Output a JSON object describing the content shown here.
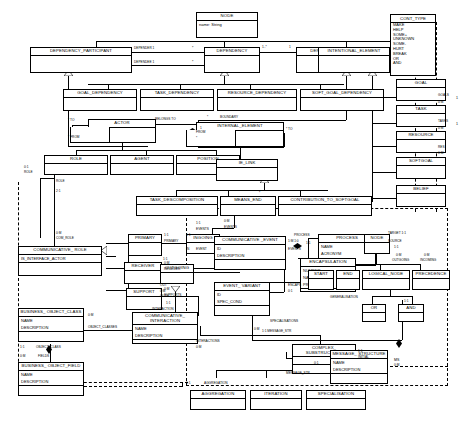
{
  "diagram": {
    "classes": [
      {
        "id": "node_top",
        "name": "NODE",
        "attrs": [
          "name: String"
        ]
      },
      {
        "id": "dependency_participant",
        "name": "DEPENDENCY_PARTICIPANT",
        "attrs": []
      },
      {
        "id": "dependency",
        "name": "DEPENDENCY",
        "attrs": []
      },
      {
        "id": "dependum",
        "name": "DEPENDUM",
        "attrs": []
      },
      {
        "id": "intentional_element",
        "name": "INTENTIONAL_ELEMENT",
        "attrs": []
      },
      {
        "id": "goal_dependency",
        "name": "GOAL_DEPENDENCY",
        "attrs": []
      },
      {
        "id": "task_dependency",
        "name": "TASK_DEPENDENCY",
        "attrs": []
      },
      {
        "id": "resource_dependency",
        "name": "RESOURCE_DEPENDENCY",
        "attrs": []
      },
      {
        "id": "soft_goal_dependency",
        "name": "SOFT_GOAL_DEPENDENCY",
        "attrs": []
      },
      {
        "id": "actor",
        "name": "ACTOR",
        "attrs": []
      },
      {
        "id": "internal_element",
        "name": "INTERNAL_ELEMENT",
        "attrs": [
          "TYPE: CONT_TYPE"
        ]
      },
      {
        "id": "role",
        "name": "ROLE",
        "attrs": []
      },
      {
        "id": "agent",
        "name": "AGENT",
        "attrs": []
      },
      {
        "id": "position",
        "name": "POSITION",
        "attrs": []
      },
      {
        "id": "ie_link",
        "name": "IE_LINK",
        "attrs": []
      },
      {
        "id": "task_descomposition",
        "name": "TASK_DESCOMPOSITION",
        "attrs": []
      },
      {
        "id": "means_end",
        "name": "MEANS_END",
        "attrs": []
      },
      {
        "id": "contribution_to_softgoal",
        "name": "CONTRIBUTION_TO_SOFTGOAL",
        "attrs": []
      },
      {
        "id": "goal",
        "name": "GOAL",
        "attrs": []
      },
      {
        "id": "task",
        "name": "TASK",
        "attrs": []
      },
      {
        "id": "resource",
        "name": "RESOURCE",
        "attrs": []
      },
      {
        "id": "softgoal",
        "name": "SOFTGOAL",
        "attrs": []
      },
      {
        "id": "belief",
        "name": "BELIEF",
        "attrs": []
      },
      {
        "id": "primary",
        "name": "PRIMARY",
        "attrs": []
      },
      {
        "id": "receiver",
        "name": "RECEIVER",
        "attrs": []
      },
      {
        "id": "support",
        "name": "SUPPORT",
        "attrs": []
      },
      {
        "id": "ingoing",
        "name": "INGOING",
        "attrs": []
      },
      {
        "id": "outgoing",
        "name": "OUTGOING",
        "attrs": []
      },
      {
        "id": "communicative_role",
        "name": "COMMUNICATIVE_ ROLE",
        "attrs": [
          "IS_INTERFACE_ACTOR"
        ]
      },
      {
        "id": "business_object_class",
        "name": "BUSINESS_ OBJECT_CLASS",
        "attrs": [
          "NAME",
          "DESCRIPTION"
        ]
      },
      {
        "id": "business_object_field",
        "name": "BUSINESS_ OBJECT_FIELD",
        "attrs": [
          "NAME",
          "DESCRIPTION"
        ]
      },
      {
        "id": "communicative_event",
        "name": "COMMUNICATIVE _EVENT",
        "attrs": [
          "ID",
          "DESCRIPTION"
        ]
      },
      {
        "id": "event_variant",
        "name": "EVENT_ VARIANT",
        "attrs": [
          "ID",
          "SPEC_COND"
        ]
      },
      {
        "id": "communicative_interaction",
        "name": "COMMUNICATIVE_ INTERACTION",
        "attrs": [
          "NAME",
          "DESCRIPTION"
        ]
      },
      {
        "id": "process",
        "name": "PROCESS",
        "attrs": [
          "NAME",
          "ACRONYM",
          "DESCRIPTION"
        ]
      },
      {
        "id": "encapsulation",
        "name": "ENCAPSULATION",
        "attrs": [
          "NUMBER",
          "NAME",
          "PRECONDITION"
        ]
      },
      {
        "id": "node_flow",
        "name": "NODE",
        "attrs": []
      },
      {
        "id": "start",
        "name": "START",
        "attrs": []
      },
      {
        "id": "end",
        "name": "END",
        "attrs": []
      },
      {
        "id": "logical_node",
        "name": "LOGICAL_NODE",
        "attrs": []
      },
      {
        "id": "precedence",
        "name": "PRECEDENCE",
        "attrs": []
      },
      {
        "id": "or",
        "name": "OR",
        "attrs": []
      },
      {
        "id": "and",
        "name": "AND",
        "attrs": []
      },
      {
        "id": "complex_substructure",
        "name": "COMPLEX_ SUBSTRUCTURE",
        "attrs": []
      },
      {
        "id": "message_structure",
        "name": "MESSAGE_ STRUCTURE",
        "attrs": [
          "NAME",
          "DESCRIPTION"
        ]
      },
      {
        "id": "aggregation",
        "name": "AGGREGATION",
        "attrs": []
      },
      {
        "id": "iteration",
        "name": "ITERATION",
        "attrs": []
      },
      {
        "id": "specialisation",
        "name": "SPECIALISATION",
        "attrs": []
      }
    ],
    "enumeration": {
      "name": "CONT_TYPE",
      "literals": [
        "MAKE",
        "HELP",
        "SOME+",
        "UNKNOWN",
        "SOME-",
        "HURT",
        "BREAK",
        "OR",
        "AND"
      ]
    },
    "labels": [
      {
        "id": "l_depender",
        "text": "DEPENDER 1"
      },
      {
        "id": "l_dependee",
        "text": "DEPENDEE 1"
      },
      {
        "id": "l_star_a",
        "text": "*"
      },
      {
        "id": "l_star_b",
        "text": "*"
      },
      {
        "id": "l_1star",
        "text": "1..*"
      },
      {
        "id": "l_1",
        "text": "1"
      },
      {
        "id": "l_to",
        "text": "* TO"
      },
      {
        "id": "l_from",
        "text": "* FROM"
      },
      {
        "id": "l_belongs",
        "text": "BELONGS TO"
      },
      {
        "id": "l_one",
        "text": "1"
      },
      {
        "id": "l_boundary",
        "text": "BOUNDARY"
      },
      {
        "id": "l_star_bound",
        "text": "*"
      },
      {
        "id": "l_from2",
        "text": "FROM"
      },
      {
        "id": "l_star_from",
        "text": "*"
      },
      {
        "id": "l_to2",
        "text": "* TO"
      },
      {
        "id": "l_star_ie",
        "text": "*"
      },
      {
        "id": "l_goals",
        "text": "GOALS"
      },
      {
        "id": "l_goals_m",
        "text": "0:M"
      },
      {
        "id": "l_tasks",
        "text": "TASKS"
      },
      {
        "id": "l_tasks_m",
        "text": "0:M"
      },
      {
        "id": "l_res",
        "text": "RES"
      },
      {
        "id": "l_res_m",
        "text": "0:M"
      },
      {
        "id": "l_right1",
        "text": "1"
      },
      {
        "id": "l_right2",
        "text": "1"
      },
      {
        "id": "l_role_01",
        "text": "0:1"
      },
      {
        "id": "l_role_lbl",
        "text": "ROLE"
      },
      {
        "id": "l_role2",
        "text": "ROLE"
      },
      {
        "id": "l_role_21",
        "text": "2:1"
      },
      {
        "id": "l_com_role_0m",
        "text": "0:M"
      },
      {
        "id": "l_com_role",
        "text": "COM_ROLE"
      },
      {
        "id": "l_obj_classes_0m",
        "text": "0:M"
      },
      {
        "id": "l_obj_classes",
        "text": "OBJECT_CLASSES"
      },
      {
        "id": "l_obj_class_11",
        "text": "1:1"
      },
      {
        "id": "l_obj_class",
        "text": "OBJECT_CLASS"
      },
      {
        "id": "l_fields_0m",
        "text": "0:M"
      },
      {
        "id": "l_fields",
        "text": "FIELDS"
      },
      {
        "id": "l_primary_11a",
        "text": "1:1"
      },
      {
        "id": "l_primary_lbl",
        "text": "PRIMARY"
      },
      {
        "id": "l_receiver_0m",
        "text": "0:M"
      },
      {
        "id": "l_receiver_lbl",
        "text": "RECEIVER"
      },
      {
        "id": "l_supports_0m",
        "text": "0:M"
      },
      {
        "id": "l_supports_lbl",
        "text": "SUPPORTS"
      },
      {
        "id": "l_ingoing_11",
        "text": "1:1"
      },
      {
        "id": "l_in_event",
        "text": "IN"
      },
      {
        "id": "l_event",
        "text": "EVENT"
      },
      {
        "id": "l_out_11",
        "text": "1:1"
      },
      {
        "id": "l_out",
        "text": "OUT"
      },
      {
        "id": "l_outs_0m",
        "text": "0:M"
      },
      {
        "id": "l_outs",
        "text": "OUTS"
      },
      {
        "id": "l_ins_11",
        "text": "1:1"
      },
      {
        "id": "l_interaction",
        "text": "INTERACTION"
      },
      {
        "id": "l_interactions_0m",
        "text": "0:M"
      },
      {
        "id": "l_interactions",
        "text": "INTERACTIONS"
      },
      {
        "id": "l_events_11",
        "text": "1:1"
      },
      {
        "id": "l_events_top",
        "text": "EVENTS"
      },
      {
        "id": "l_events_0m",
        "text": "0:M"
      },
      {
        "id": "l_events_top2",
        "text": "EVENTS"
      },
      {
        "id": "l_events_right",
        "text": "EVENTS"
      },
      {
        "id": "l_1m10",
        "text": "1:M 1:0"
      },
      {
        "id": "l_process_11",
        "text": "1:1"
      },
      {
        "id": "l_process",
        "text": "PROCESS"
      },
      {
        "id": "l_encaps",
        "text": "ENCAPS"
      },
      {
        "id": "l_encaps_01",
        "text": "0:1"
      },
      {
        "id": "l_generalisation",
        "text": "GENERALISATION"
      },
      {
        "id": "l_gen_11",
        "text": "1:1"
      },
      {
        "id": "l_specialisations",
        "text": "SPECIALISATIONS"
      },
      {
        "id": "l_spec_0m",
        "text": "0:M"
      },
      {
        "id": "l_target",
        "text": "TARGET 1:1"
      },
      {
        "id": "l_source",
        "text": "SOURCE"
      },
      {
        "id": "l_source_11",
        "text": "1:1"
      },
      {
        "id": "l_outgoing_0m",
        "text": "0:M"
      },
      {
        "id": "l_outgoing_lbl",
        "text": "OUTGOING"
      },
      {
        "id": "l_incoming_0m",
        "text": "0:M"
      },
      {
        "id": "l_incoming_lbl",
        "text": "INCOMING"
      },
      {
        "id": "l_initial_11",
        "text": "1:1"
      },
      {
        "id": "l_initial",
        "text": "INITIAL"
      },
      {
        "id": "l_msgstr_11",
        "text": "1:1 MESSAGE_STR"
      },
      {
        "id": "l_msgstr_01",
        "text": "0:1"
      },
      {
        "id": "l_msgstr_lbl",
        "text": "MESSAGE_STR"
      },
      {
        "id": "l_ms",
        "text": "MS"
      },
      {
        "id": "l_ms_0m",
        "text": "0:M"
      },
      {
        "id": "l_aggregation_11",
        "text": "1:1"
      },
      {
        "id": "l_aggregation_lbl",
        "text": "AGGREGATION"
      }
    ]
  }
}
